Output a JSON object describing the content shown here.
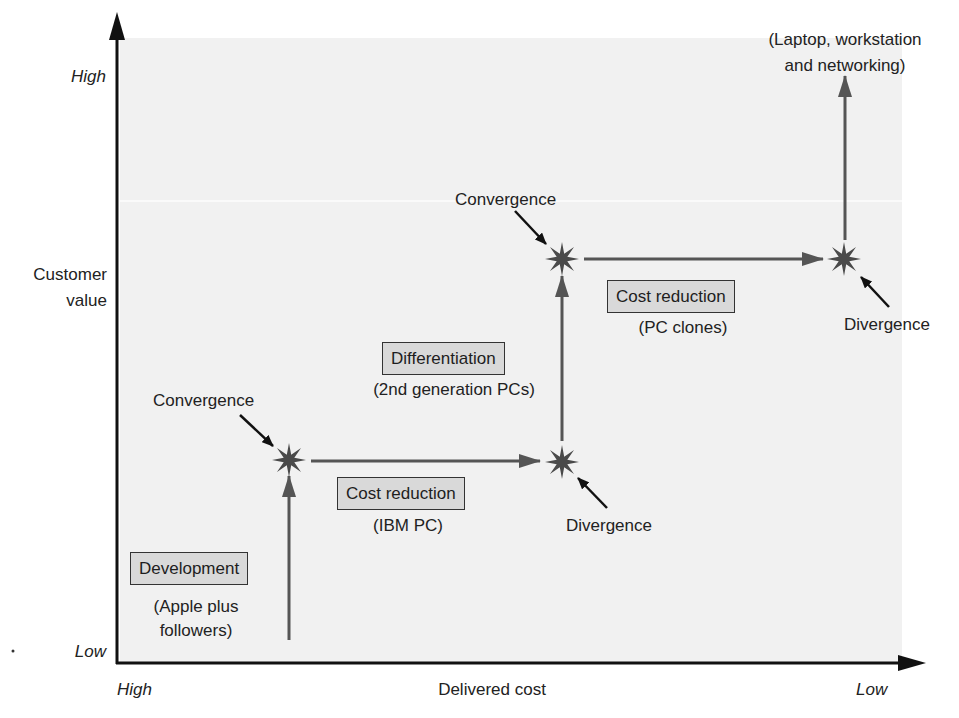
{
  "axes": {
    "y_label_line1": "Customer",
    "y_label_line2": "value",
    "y_high": "High",
    "y_low": "Low",
    "x_label": "Delivered cost",
    "x_left": "High",
    "x_right": "Low"
  },
  "stages": [
    {
      "title": "Development",
      "subtitle_line1": "(Apple plus",
      "subtitle_line2": "followers)"
    },
    {
      "title": "Cost reduction",
      "subtitle_line1": "(IBM PC)"
    },
    {
      "title": "Differentiation",
      "subtitle_line1": "(2nd generation PCs)"
    },
    {
      "title": "Cost reduction",
      "subtitle_line1": "(PC clones)"
    }
  ],
  "events": {
    "convergence_1": "Convergence",
    "divergence_1": "Divergence",
    "convergence_2": "Convergence",
    "divergence_2": "Divergence"
  },
  "endpoint": {
    "line1": "(Laptop, workstation",
    "line2": "and networking)"
  },
  "colors": {
    "panel": "#f1f1f1",
    "box_fill": "#d9d9d9",
    "path": "#555555",
    "axis": "#111111"
  }
}
